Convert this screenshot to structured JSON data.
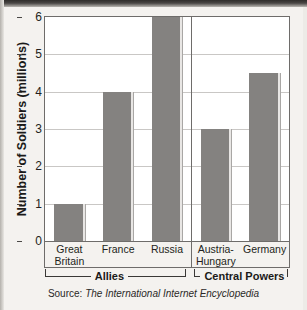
{
  "chart_data": {
    "type": "bar",
    "title": "",
    "xlabel": "",
    "ylabel": "Number of Soldiers (millions)",
    "ylim": [
      0,
      6
    ],
    "yticks": [
      0,
      1,
      2,
      3,
      4,
      5,
      6
    ],
    "grid": true,
    "legend": "none",
    "units": "millions",
    "categories": [
      "Great Britain",
      "France",
      "Russia",
      "Austria-Hungary",
      "Germany"
    ],
    "values": [
      1,
      4,
      6,
      3,
      4.5
    ],
    "groups": [
      {
        "name": "Allies",
        "categories": [
          "Great Britain",
          "France",
          "Russia"
        ]
      },
      {
        "name": "Central Powers",
        "categories": [
          "Austria-Hungary",
          "Germany"
        ]
      }
    ],
    "bar_color": "#848280"
  },
  "axis": {
    "y_title": "Number of Soldiers (millions)",
    "ticks": [
      "6",
      "5",
      "4",
      "3",
      "2",
      "1",
      "0"
    ]
  },
  "categories": [
    {
      "line1": "Great",
      "line2": "Britain"
    },
    {
      "line1": "France",
      "line2": ""
    },
    {
      "line1": "Russia",
      "line2": ""
    },
    {
      "line1": "Austria-",
      "line2": "Hungary"
    },
    {
      "line1": "Germany",
      "line2": ""
    }
  ],
  "groups": {
    "allies": "Allies",
    "central": "Central Powers"
  },
  "source": {
    "prefix": "Source:",
    "title": "The International Internet Encyclopedia"
  },
  "colors": {
    "bar": "#848280",
    "grid": "#c9c7c5",
    "frame": "#6e6c6a",
    "page": "#f4f2ef"
  }
}
